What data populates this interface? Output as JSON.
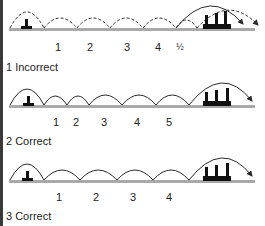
{
  "diagram": {
    "colors": {
      "ground": "#a9a9a9",
      "arc": "#2a2a2a",
      "hurdle": "#111111"
    },
    "rows": [
      {
        "id": 1,
        "caption": "1 Incorrect",
        "stride_labels": [
          "1",
          "2",
          "3",
          "4",
          "½"
        ],
        "arc_style": "dashed"
      },
      {
        "id": 2,
        "caption": "2 Correct",
        "stride_labels": [
          "1",
          "2",
          "3",
          "4",
          "5"
        ],
        "arc_style": "solid"
      },
      {
        "id": 3,
        "caption": "3 Correct",
        "stride_labels": [
          "1",
          "2",
          "3",
          "4"
        ],
        "arc_style": "solid"
      }
    ]
  }
}
